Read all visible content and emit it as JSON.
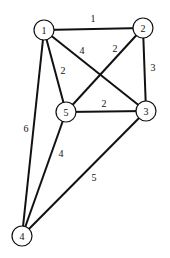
{
  "diagram": {
    "type": "weighted-undirected-graph",
    "colors": {
      "stroke": "#111111",
      "fill": "#ffffff",
      "background": "#ffffff"
    },
    "node_radius": 10,
    "nodes": [
      {
        "id": "1",
        "label": "1",
        "x": 44,
        "y": 30
      },
      {
        "id": "2",
        "label": "2",
        "x": 143,
        "y": 28
      },
      {
        "id": "3",
        "label": "3",
        "x": 146,
        "y": 111
      },
      {
        "id": "4",
        "label": "4",
        "x": 22,
        "y": 236
      },
      {
        "id": "5",
        "label": "5",
        "x": 66,
        "y": 112
      }
    ],
    "edges": [
      {
        "from": "1",
        "to": "2",
        "weight": "1",
        "label_x": 93,
        "label_y": 18
      },
      {
        "from": "1",
        "to": "3",
        "weight": "4",
        "label_x": 82,
        "label_y": 50
      },
      {
        "from": "1",
        "to": "5",
        "weight": "2",
        "label_x": 63,
        "label_y": 70
      },
      {
        "from": "1",
        "to": "4",
        "weight": "6",
        "label_x": 26,
        "label_y": 128
      },
      {
        "from": "2",
        "to": "5",
        "weight": "2",
        "label_x": 115,
        "label_y": 48
      },
      {
        "from": "2",
        "to": "3",
        "weight": "3",
        "label_x": 153,
        "label_y": 67
      },
      {
        "from": "5",
        "to": "3",
        "weight": "2",
        "label_x": 104,
        "label_y": 103
      },
      {
        "from": "5",
        "to": "4",
        "weight": "4",
        "label_x": 61,
        "label_y": 153
      },
      {
        "from": "3",
        "to": "4",
        "weight": "5",
        "label_x": 94,
        "label_y": 177
      }
    ]
  }
}
